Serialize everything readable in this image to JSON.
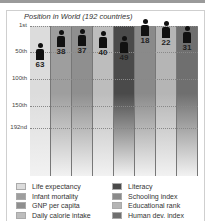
{
  "chart_data": {
    "type": "bar",
    "title": "Position in World (192 countries)",
    "xlabel": "",
    "ylabel": "",
    "y_ticks": [
      "1st",
      "50th",
      "100th",
      "150th",
      "192nd"
    ],
    "ylim": [
      1,
      192
    ],
    "y_inverted": true,
    "categories": [
      "Life expectancy",
      "Infant mortality",
      "GNP per capita",
      "Daily calorie intake",
      "Literacy",
      "Schooling index",
      "Educational rank",
      "Human dev. index"
    ],
    "values": [
      63,
      38,
      37,
      40,
      49,
      18,
      22,
      31
    ],
    "colors": [
      "#dcdcdc",
      "#9e9e9e",
      "#8f8f8f",
      "#bdbdbd",
      "#4a4a4a",
      "#8a8a8a",
      "#b5b5b5",
      "#6f6f6f"
    ],
    "grid": true,
    "legend_position": "bottom"
  },
  "legend": {
    "left": [
      "Life expectancy",
      "Infant mortality",
      "GNP per capita",
      "Daily calorie intake"
    ],
    "right": [
      "Literacy",
      "Schooling index",
      "Educational rank",
      "Human dev. index"
    ]
  }
}
